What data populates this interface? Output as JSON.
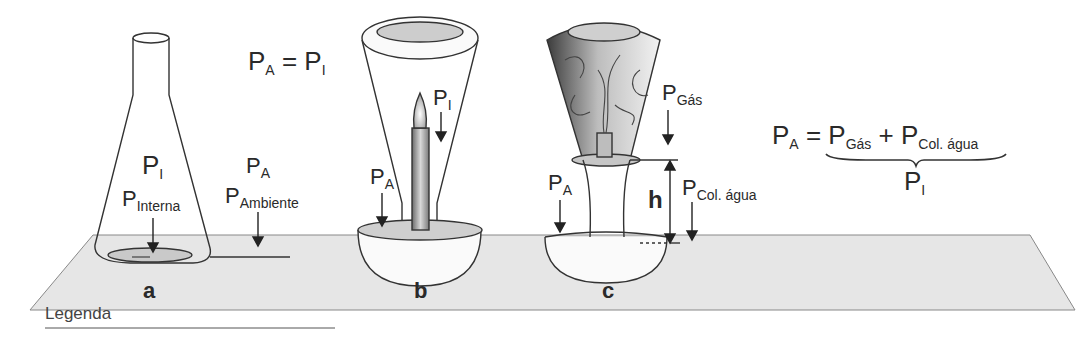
{
  "figure": {
    "panels": [
      {
        "id": "a",
        "label": "a",
        "apparatus": "erlenmeyer-flask",
        "labels": {
          "pi": {
            "main": "P",
            "sub": "I"
          },
          "p_interna": {
            "main": "P",
            "sub": "Interna"
          },
          "pa": {
            "main": "P",
            "sub": "A"
          },
          "p_ambiente": {
            "main": "P",
            "sub": "Ambiente"
          }
        }
      },
      {
        "id": "b",
        "label": "b",
        "apparatus": "inverted-funnel-over-candle",
        "labels": {
          "pi": {
            "main": "P",
            "sub": "I"
          },
          "pa": {
            "main": "P",
            "sub": "A"
          }
        }
      },
      {
        "id": "c",
        "label": "c",
        "apparatus": "inverted-funnel-smoke-water-column",
        "labels": {
          "p_gas": {
            "main": "P",
            "sub": "Gás"
          },
          "pa": {
            "main": "P",
            "sub": "A"
          },
          "h": "h",
          "p_col": {
            "main": "P",
            "sub": "Col. água"
          }
        }
      }
    ],
    "equation_top": {
      "lhs_main": "P",
      "lhs_sub": "A",
      "eq": " = ",
      "rhs_main": "P",
      "rhs_sub": "I"
    },
    "equation_right": {
      "lhs_main": "P",
      "lhs_sub": "A",
      "eq": " = ",
      "t1_main": "P",
      "t1_sub": "Gás",
      "plus": " + ",
      "t2_main": "P",
      "t2_sub": "Col. água",
      "brace_label_main": "P",
      "brace_label_sub": "I"
    },
    "legend_title": "Legenda"
  }
}
